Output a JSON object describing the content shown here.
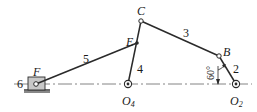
{
  "diagram": {
    "type": "planar six-bar linkage mechanism",
    "colors": {
      "link": "#2a2a2a",
      "slider_fill": "#c8c8c8",
      "centerline": "#555555",
      "background": "#ffffff"
    },
    "points": {
      "F": {
        "label": "F",
        "x": 36,
        "y": 84
      },
      "E": {
        "label": "E",
        "x": 137,
        "y": 43
      },
      "C": {
        "label": "C",
        "x": 141,
        "y": 21
      },
      "B": {
        "label": "B",
        "x": 219,
        "y": 56
      },
      "O4": {
        "label": "O",
        "sub": "4",
        "x": 128,
        "y": 84
      },
      "O2": {
        "label": "O",
        "sub": "2",
        "x": 236,
        "y": 84
      }
    },
    "links": [
      {
        "id": "2",
        "label": "2",
        "from": "O2",
        "to": "B"
      },
      {
        "id": "3",
        "label": "3",
        "from": "B",
        "to": "C"
      },
      {
        "id": "4",
        "label": "4",
        "from": "O4",
        "to": "C"
      },
      {
        "id": "5",
        "label": "5",
        "from": "E",
        "to": "F"
      },
      {
        "id": "6",
        "label": "6",
        "kind": "slider"
      }
    ],
    "angle": {
      "value": "60°",
      "between": "link 2 and vertical at O2"
    }
  }
}
